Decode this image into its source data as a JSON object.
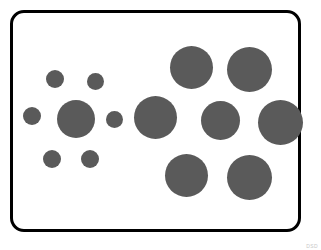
{
  "figure": {
    "name": "ebbinghaus-illusion",
    "canvas": {
      "width": 321,
      "height": 250,
      "background": "#ffffff"
    },
    "frame": {
      "x": 10,
      "y": 10,
      "width": 291,
      "height": 222,
      "stroke": "#000000",
      "stroke_width": 3,
      "corner_radius": 14,
      "fill": "#ffffff"
    },
    "circle_fill": "#5a5a5a",
    "watermark": "DSD"
  },
  "chart_data": {
    "type": "scatter",
    "xlabel": "",
    "ylabel": "",
    "xlim": [
      0,
      321
    ],
    "ylim": [
      0,
      250
    ],
    "grid": false,
    "legend": "none",
    "units": "pixels",
    "note": "Two target circles of nearly equal size; left target is ringed by six small inducers, right target is ringed by five large inducers.",
    "series": [
      {
        "name": "left-target",
        "role": "target",
        "values": [
          {
            "id": "left-target-circle",
            "cx": 76,
            "cy": 119,
            "r": 19,
            "d": 38
          }
        ]
      },
      {
        "name": "left-inducers-small",
        "role": "inducer",
        "values": [
          {
            "id": "left-inducer-top-left",
            "cx": 55,
            "cy": 79,
            "r": 9,
            "d": 18
          },
          {
            "id": "left-inducer-top-right",
            "cx": 95,
            "cy": 81,
            "r": 8.5,
            "d": 17
          },
          {
            "id": "left-inducer-left",
            "cx": 32,
            "cy": 116,
            "r": 9,
            "d": 18
          },
          {
            "id": "left-inducer-right",
            "cx": 114,
            "cy": 119,
            "r": 8.5,
            "d": 17
          },
          {
            "id": "left-inducer-bottom-left",
            "cx": 52,
            "cy": 159,
            "r": 9,
            "d": 18
          },
          {
            "id": "left-inducer-bottom-right",
            "cx": 90,
            "cy": 159,
            "r": 9,
            "d": 18
          }
        ]
      },
      {
        "name": "right-target",
        "role": "target",
        "values": [
          {
            "id": "right-target-circle",
            "cx": 155,
            "cy": 117,
            "r": 21.5,
            "d": 43
          }
        ]
      },
      {
        "name": "right-inducers-large",
        "role": "inducer",
        "values": [
          {
            "id": "right-inducer-top-left",
            "cx": 191.5,
            "cy": 67.5,
            "r": 21.5,
            "d": 43
          },
          {
            "id": "right-inducer-top-right",
            "cx": 249.5,
            "cy": 69.5,
            "r": 22.5,
            "d": 45
          },
          {
            "id": "right-inducer-middle",
            "cx": 220.5,
            "cy": 120.5,
            "r": 19.5,
            "d": 39
          },
          {
            "id": "right-inducer-far-right",
            "cx": 280.5,
            "cy": 122.5,
            "r": 22.5,
            "d": 45
          },
          {
            "id": "right-inducer-bottom-left",
            "cx": 186.5,
            "cy": 175.5,
            "r": 21.5,
            "d": 43
          },
          {
            "id": "right-inducer-bottom-right",
            "cx": 249.5,
            "cy": 177.5,
            "r": 22.5,
            "d": 45
          }
        ]
      }
    ]
  }
}
